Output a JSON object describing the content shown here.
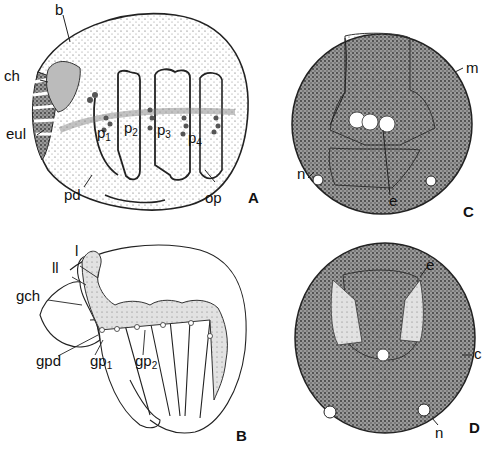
{
  "figure": {
    "panels": [
      {
        "id": "A",
        "letter": "A",
        "labels": [
          "b",
          "ch",
          "eul",
          "p1",
          "p2",
          "p3",
          "p4",
          "pd",
          "op"
        ]
      },
      {
        "id": "B",
        "letter": "B",
        "labels": [
          "l",
          "ll",
          "gch",
          "gpd",
          "gp1",
          "gp2"
        ]
      },
      {
        "id": "C",
        "letter": "C",
        "labels": [
          "m",
          "n",
          "e"
        ]
      },
      {
        "id": "D",
        "letter": "D",
        "labels": [
          "e",
          "c",
          "n"
        ]
      }
    ],
    "panelA": {
      "letter": "A",
      "b": "b",
      "ch": "ch",
      "eul": "eul",
      "pd": "pd",
      "op": "op",
      "p": "p",
      "p1_sub": "1",
      "p2_sub": "2",
      "p3_sub": "3",
      "p4_sub": "4"
    },
    "panelB": {
      "letter": "B",
      "l": "l",
      "ll": "ll",
      "gch": "gch",
      "gpd": "gpd",
      "gp": "gp",
      "gp1_sub": "1",
      "gp2_sub": "2"
    },
    "panelC": {
      "letter": "C",
      "m": "m",
      "n": "n",
      "e": "e"
    },
    "panelD": {
      "letter": "D",
      "e": "e",
      "c": "c",
      "n": "n"
    }
  }
}
